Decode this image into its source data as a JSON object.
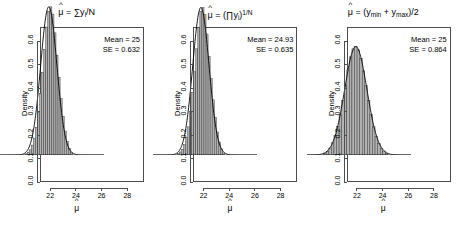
{
  "figure": {
    "background": "#ffffff",
    "panel_count": 3,
    "axis_color": "#4d4d4d",
    "bar_fill": "#b3b3b3",
    "bar_edge": "#333333",
    "curve_color": "#000000"
  },
  "panels": [
    {
      "id": "panel-mean",
      "title_parts": {
        "hat": "^",
        "mu": "μ",
        "equals": " = ",
        "body": "∑y",
        "subscript": "i",
        "tail": "/N"
      },
      "title_plain": "μ̂ = ∑yᵢ/N",
      "annotation": {
        "mean_label": "Mean = 25",
        "se_label": "SE = 0.632"
      },
      "ylabel": "Density",
      "xlabel": "μ̂",
      "chart_data": {
        "type": "bar",
        "title": "μ̂ = ∑yᵢ/N",
        "xlabel": "μ̂",
        "ylabel": "Density",
        "xlim": [
          21.2,
          29.3
        ],
        "ylim": [
          0.0,
          0.66
        ],
        "xticks": [
          "22",
          "24",
          "26",
          "28"
        ],
        "xtick_values": [
          22,
          24,
          26,
          28
        ],
        "yticks": [
          "0.0",
          "0.1",
          "0.2",
          "0.3",
          "0.4",
          "0.5",
          "0.6"
        ],
        "ytick_values": [
          0.0,
          0.1,
          0.2,
          0.3,
          0.4,
          0.5,
          0.6
        ],
        "grid": false,
        "legend": "none",
        "mean": 25,
        "se": 0.632,
        "peak_density": 0.631,
        "bin_width": 0.16,
        "series": [
          {
            "name": "histogram",
            "bin_centers": [
              23.24,
              23.4,
              23.56,
              23.72,
              23.88,
              24.04,
              24.2,
              24.36,
              24.52,
              24.68,
              24.84,
              25.0,
              25.16,
              25.32,
              25.48,
              25.64,
              25.8,
              25.96,
              26.12,
              26.28,
              26.44,
              26.6,
              26.76
            ],
            "values": [
              0.005,
              0.012,
              0.022,
              0.042,
              0.072,
              0.118,
              0.182,
              0.262,
              0.352,
              0.45,
              0.545,
              0.612,
              0.631,
              0.6,
              0.52,
              0.425,
              0.33,
              0.24,
              0.165,
              0.102,
              0.058,
              0.028,
              0.01
            ]
          },
          {
            "name": "density-curve",
            "mean": 25,
            "sd": 0.632,
            "peak": 0.631
          }
        ]
      }
    },
    {
      "id": "panel-geometric",
      "title_parts": {
        "hat": "^",
        "mu": "μ",
        "equals": " = ",
        "body": "(∏y",
        "subscript": "i",
        "tail": ")",
        "exponent": "1/N"
      },
      "title_plain": "μ̂ = (∏yᵢ)^(1/N)",
      "annotation": {
        "mean_label": "Mean = 24.93",
        "se_label": "SE = 0.635"
      },
      "ylabel": "Density",
      "xlabel": "μ̂",
      "chart_data": {
        "type": "bar",
        "title": "μ̂ = (∏yᵢ)^(1/N)",
        "xlabel": "μ̂",
        "ylabel": "Density",
        "xlim": [
          21.2,
          29.3
        ],
        "ylim": [
          0.0,
          0.66
        ],
        "xticks": [
          "22",
          "24",
          "26",
          "28"
        ],
        "xtick_values": [
          22,
          24,
          26,
          28
        ],
        "yticks": [
          "0.0",
          "0.1",
          "0.2",
          "0.3",
          "0.4",
          "0.5",
          "0.6"
        ],
        "ytick_values": [
          0.0,
          0.1,
          0.2,
          0.3,
          0.4,
          0.5,
          0.6
        ],
        "grid": false,
        "legend": "none",
        "mean": 24.93,
        "se": 0.635,
        "peak_density": 0.628,
        "bin_width": 0.16,
        "series": [
          {
            "name": "histogram",
            "bin_centers": [
              23.17,
              23.33,
              23.49,
              23.65,
              23.81,
              23.97,
              24.13,
              24.29,
              24.45,
              24.61,
              24.77,
              24.93,
              25.09,
              25.25,
              25.41,
              25.57,
              25.73,
              25.89,
              26.05,
              26.21,
              26.37,
              26.53,
              26.69
            ],
            "values": [
              0.006,
              0.013,
              0.024,
              0.044,
              0.075,
              0.12,
              0.185,
              0.265,
              0.355,
              0.452,
              0.543,
              0.61,
              0.628,
              0.598,
              0.515,
              0.42,
              0.325,
              0.235,
              0.16,
              0.098,
              0.055,
              0.026,
              0.009
            ]
          },
          {
            "name": "density-curve",
            "mean": 24.93,
            "sd": 0.635,
            "peak": 0.628
          }
        ]
      }
    },
    {
      "id": "panel-midrange",
      "title_parts": {
        "hat": "^",
        "mu": "μ",
        "equals": " = (y",
        "subscript": "min",
        "plus": " + y",
        "subscript2": "max",
        "tail": ")/2"
      },
      "title_plain": "μ̂ = (y_min + y_max)/2",
      "annotation": {
        "mean_label": "Mean = 25",
        "se_label": "SE = 0.864"
      },
      "ylabel": "Density",
      "xlabel": "μ̂",
      "chart_data": {
        "type": "bar",
        "title": "μ̂ = (y_min + y_max)/2",
        "xlabel": "μ̂",
        "ylabel": "Density",
        "xlim": [
          21.2,
          29.3
        ],
        "ylim": [
          0.0,
          0.66
        ],
        "xticks": [
          "22",
          "24",
          "26",
          "28"
        ],
        "xtick_values": [
          22,
          24,
          26,
          28
        ],
        "yticks": [
          "0.0",
          "0.1",
          "0.2",
          "0.3",
          "0.4",
          "0.5",
          "0.6"
        ],
        "ytick_values": [
          0.0,
          0.1,
          0.2,
          0.3,
          0.4,
          0.5,
          0.6
        ],
        "grid": false,
        "legend": "none",
        "mean": 25,
        "se": 0.864,
        "peak_density": 0.462,
        "bin_width": 0.2,
        "series": [
          {
            "name": "histogram",
            "bin_centers": [
              22.6,
              22.8,
              23.0,
              23.2,
              23.4,
              23.6,
              23.8,
              24.0,
              24.2,
              24.4,
              24.6,
              24.8,
              25.0,
              25.2,
              25.4,
              25.6,
              25.8,
              26.0,
              26.2,
              26.4,
              26.6,
              26.8,
              27.0,
              27.2,
              27.4
            ],
            "values": [
              0.008,
              0.016,
              0.03,
              0.052,
              0.082,
              0.122,
              0.172,
              0.232,
              0.298,
              0.362,
              0.418,
              0.452,
              0.462,
              0.448,
              0.412,
              0.358,
              0.295,
              0.232,
              0.172,
              0.12,
              0.08,
              0.05,
              0.028,
              0.014,
              0.006
            ]
          },
          {
            "name": "density-curve",
            "mean": 25,
            "sd": 0.864,
            "peak": 0.462
          }
        ]
      }
    }
  ]
}
